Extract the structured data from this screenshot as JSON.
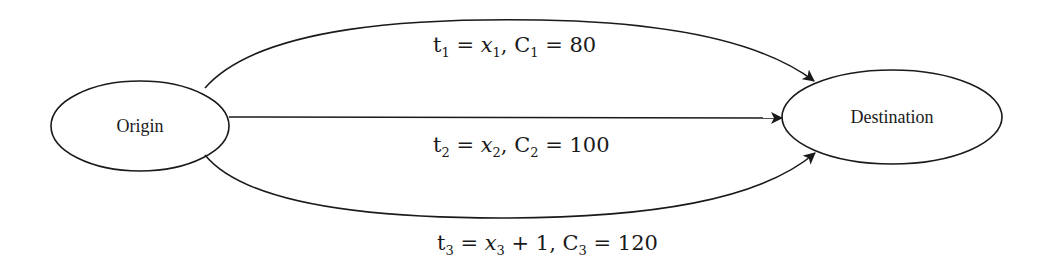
{
  "diagram": {
    "type": "network-flow",
    "nodes": [
      {
        "id": "origin",
        "label": "Origin"
      },
      {
        "id": "destination",
        "label": "Destination"
      }
    ],
    "edges": [
      {
        "id": "route-1",
        "from": "origin",
        "to": "destination",
        "label": {
          "t": "t",
          "t_sub": "1",
          "eq": " = ",
          "x": "x",
          "x_sub": "1",
          "extra": "",
          "c": ", C",
          "c_sub": "1",
          "c_eq": " = ",
          "cost": "80"
        },
        "position": "top"
      },
      {
        "id": "route-2",
        "from": "origin",
        "to": "destination",
        "label": {
          "t": "t",
          "t_sub": "2",
          "eq": " = ",
          "x": "x",
          "x_sub": "2",
          "extra": "",
          "c": ", C",
          "c_sub": "2",
          "c_eq": " = ",
          "cost": "100"
        },
        "position": "middle"
      },
      {
        "id": "route-3",
        "from": "origin",
        "to": "destination",
        "label": {
          "t": "t",
          "t_sub": "3",
          "eq": " = ",
          "x": "x",
          "x_sub": "3",
          "extra": " + 1",
          "c": ", C",
          "c_sub": "3",
          "c_eq": " = ",
          "cost": "120"
        },
        "position": "bottom"
      }
    ],
    "colors": {
      "stroke": "#1a1a1a",
      "background": "#ffffff"
    }
  }
}
